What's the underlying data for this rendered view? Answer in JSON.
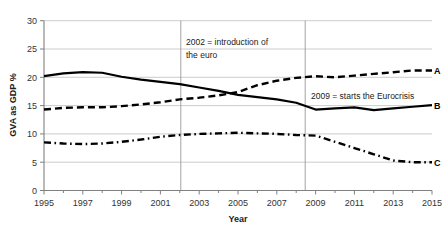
{
  "chart_data": {
    "type": "line",
    "title": "",
    "xlabel": "Year",
    "ylabel": "GVA as GDP %",
    "xlim": [
      1995,
      2015
    ],
    "ylim": [
      0,
      30
    ],
    "ytick_step": 5,
    "yticks": [
      0,
      5,
      10,
      15,
      20,
      25,
      30
    ],
    "ytick_labels": [
      "0",
      "5",
      "10",
      "15",
      "20",
      "25",
      "30"
    ],
    "xticks": [
      1995,
      1997,
      1999,
      2001,
      2003,
      2005,
      2007,
      2009,
      2011,
      2013,
      2015
    ],
    "xtick_labels": [
      "1995",
      "1997",
      "1999",
      "2001",
      "2003",
      "2005",
      "2007",
      "2009",
      "2011",
      "2013",
      "2015"
    ],
    "x": [
      1995,
      1996,
      1997,
      1998,
      1999,
      2000,
      2001,
      2002,
      2003,
      2004,
      2005,
      2006,
      2007,
      2008,
      2009,
      2010,
      2011,
      2012,
      2013,
      2014,
      2015
    ],
    "grid": "horizontal",
    "legend": "series-end-labels",
    "series": [
      {
        "name": "A",
        "label": "A",
        "style": "dashed",
        "color": "#000000",
        "values": [
          14.3,
          14.6,
          14.7,
          14.7,
          14.9,
          15.2,
          15.6,
          16.1,
          16.4,
          16.8,
          17.4,
          18.6,
          19.4,
          19.9,
          20.2,
          20.0,
          20.3,
          20.6,
          20.9,
          21.2,
          21.2
        ]
      },
      {
        "name": "B",
        "label": "B",
        "style": "solid",
        "color": "#000000",
        "values": [
          20.2,
          20.7,
          20.9,
          20.8,
          20.1,
          19.6,
          19.2,
          18.8,
          18.2,
          17.6,
          16.9,
          16.5,
          16.1,
          15.5,
          14.3,
          14.5,
          14.7,
          14.2,
          14.5,
          14.8,
          15.1
        ]
      },
      {
        "name": "C",
        "label": "C",
        "style": "dashdot",
        "color": "#000000",
        "values": [
          8.5,
          8.3,
          8.2,
          8.3,
          8.6,
          9.0,
          9.5,
          9.8,
          10.0,
          10.1,
          10.2,
          10.1,
          10.0,
          9.8,
          9.7,
          8.6,
          7.5,
          6.4,
          5.3,
          5.0,
          5.0
        ]
      }
    ],
    "annotations": [
      {
        "id": "euro-intro",
        "lines": [
          "2002 = introduction of",
          "the euro"
        ],
        "line1": "2002 = introduction of",
        "line2": "the euro",
        "marker_x": 2002
      },
      {
        "id": "eurocrisis-start",
        "lines": [
          "2009 = starts the Eurocrisis"
        ],
        "line1": "2009 = starts the Eurocrisis",
        "marker_x": 2009
      }
    ],
    "vertical_markers": [
      2002,
      2009
    ]
  },
  "colors": {
    "line": "#000000",
    "grid": "#bfbfbf",
    "axis": "#808080",
    "text": "#1a1a1a",
    "background": "#ffffff"
  }
}
